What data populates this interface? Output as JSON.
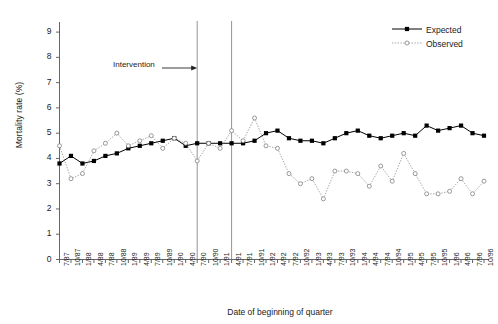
{
  "chart_data": {
    "type": "line",
    "title": "",
    "xlabel": "Date of beginning of quarter",
    "ylabel": "Mortality rate (%)",
    "ylim": [
      0,
      9.4
    ],
    "yticks": [
      0,
      1,
      2,
      3,
      4,
      5,
      6,
      7,
      8,
      9
    ],
    "grid": false,
    "legend_position": "top-right",
    "categories": [
      "7/87",
      "10/87",
      "1/88",
      "4/88",
      "7/88",
      "10/88",
      "1/89",
      "4/89",
      "7/89",
      "10/89",
      "1/90",
      "4/90",
      "7/90",
      "10/90",
      "1/91",
      "4/91",
      "7/91",
      "10/91",
      "1/92",
      "4/92",
      "7/92",
      "10/92",
      "1/93",
      "4/93",
      "7/93",
      "10/93",
      "1/94",
      "4/94",
      "7/94",
      "10/94",
      "1/95",
      "4/95",
      "7/95",
      "10/95",
      "1/96",
      "4/96",
      "7/96",
      "10/96"
    ],
    "series": [
      {
        "name": "Expected",
        "marker": "filled-square",
        "color": "#000000",
        "linestyle": "solid",
        "values": [
          3.8,
          4.1,
          3.8,
          3.9,
          4.1,
          4.2,
          4.4,
          4.5,
          4.6,
          4.7,
          4.8,
          4.5,
          4.6,
          4.6,
          4.6,
          4.6,
          4.6,
          4.7,
          5.0,
          5.1,
          4.8,
          4.7,
          4.7,
          4.6,
          4.8,
          5.0,
          5.1,
          4.9,
          4.8,
          4.9,
          5.0,
          4.9,
          5.3,
          5.1,
          5.2,
          5.3,
          5.0,
          4.9
        ]
      },
      {
        "name": "Observed",
        "marker": "open-circle",
        "color": "#808080",
        "linestyle": "dotted",
        "values": [
          4.5,
          3.2,
          3.4,
          4.3,
          4.6,
          5.0,
          4.5,
          4.7,
          4.9,
          4.4,
          4.8,
          4.6,
          3.9,
          4.6,
          4.4,
          5.1,
          4.7,
          5.6,
          4.5,
          4.4,
          3.4,
          3.0,
          3.2,
          2.4,
          3.5,
          3.5,
          3.4,
          2.9,
          3.7,
          3.1,
          4.2,
          3.4,
          2.6,
          2.6,
          2.7,
          3.2,
          2.6,
          3.1
        ]
      }
    ],
    "annotations": [
      {
        "text": "Intervention",
        "arrow": "→",
        "target_category": "7/90"
      }
    ],
    "vertical_lines": [
      {
        "at_category": "7/90"
      },
      {
        "at_category": "4/91"
      }
    ]
  },
  "legend": {
    "items": [
      {
        "label": "Expected"
      },
      {
        "label": "Observed"
      }
    ]
  }
}
